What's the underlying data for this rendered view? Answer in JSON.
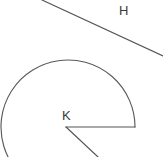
{
  "figure": {
    "background_color": "#ffffff",
    "stroke_color": "#555555",
    "canvas": {
      "width": 163,
      "height": 157
    }
  },
  "labels": {
    "line_label": "H",
    "vertex_label": "K"
  },
  "chart_data": {
    "type": "diagram",
    "title": "",
    "elements": [
      {
        "name": "line-H",
        "kind": "segment",
        "label": "H",
        "label_position": {
          "x": 124,
          "y": 10
        },
        "from": {
          "x": 42,
          "y": 0
        },
        "to": {
          "x": 163,
          "y": 56
        }
      },
      {
        "name": "reflex-angle-arc",
        "kind": "arc",
        "center": {
          "x": 68,
          "y": 127
        },
        "radius": 67,
        "start_angle_deg": 0,
        "end_angle_deg": 295,
        "direction": "counterclockwise"
      },
      {
        "name": "ray-horizontal",
        "kind": "ray",
        "from": {
          "x": 66,
          "y": 127
        },
        "to": {
          "x": 135,
          "y": 127
        }
      },
      {
        "name": "ray-lower-right",
        "kind": "ray",
        "from": {
          "x": 66,
          "y": 127
        },
        "to": {
          "x": 98,
          "y": 157
        }
      },
      {
        "name": "vertex-K",
        "kind": "point",
        "label": "K",
        "position": {
          "x": 66,
          "y": 127
        },
        "label_position": {
          "x": 67,
          "y": 116
        }
      }
    ]
  }
}
